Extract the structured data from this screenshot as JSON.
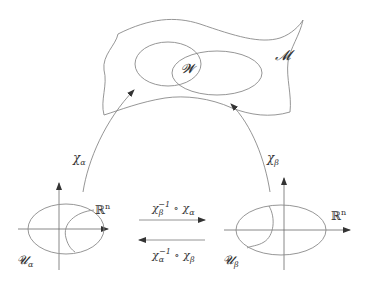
{
  "diagram": {
    "type": "manifold-charts",
    "manifold_label": "𝓜",
    "overlap_label": "𝓦",
    "left_chart": {
      "map_label": "χ",
      "map_sub": "α",
      "domain_label": "𝓤",
      "domain_sub": "α",
      "space_label": "ℝ",
      "space_sup": "n"
    },
    "right_chart": {
      "map_label": "χ",
      "map_sub": "β",
      "domain_label": "𝓤",
      "domain_sub": "β",
      "space_label": "ℝ",
      "space_sup": "n"
    },
    "transition_top": {
      "base": "χ",
      "sub": "β",
      "sup": "−1",
      "compose": " ∘ ",
      "second": "χ",
      "second_sub": "α"
    },
    "transition_bottom": {
      "base": "χ",
      "sub": "α",
      "sup": "−1",
      "compose": " ∘ ",
      "second": "χ",
      "second_sub": "β"
    },
    "colors": {
      "stroke": "#8a8a8a",
      "text": "#333333"
    }
  }
}
